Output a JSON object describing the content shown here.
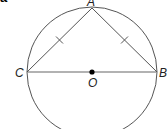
{
  "part_label": "a",
  "figure": {
    "circle": {
      "center": "O",
      "cx": 92,
      "cy": 72,
      "r": 65,
      "stroke": "#555555"
    },
    "points": {
      "A": {
        "label": "A",
        "x": 92,
        "y": 8
      },
      "B": {
        "label": "B",
        "x": 157,
        "y": 72
      },
      "C": {
        "label": "C",
        "x": 27,
        "y": 72
      },
      "O": {
        "label": "O",
        "x": 92,
        "y": 72
      }
    },
    "segments": [
      {
        "from": "C",
        "to": "A",
        "tick_marks": 1
      },
      {
        "from": "A",
        "to": "B",
        "tick_marks": 1
      },
      {
        "from": "C",
        "to": "B",
        "tick_marks": 0,
        "diameter": true
      }
    ],
    "colors": {
      "line": "#555555",
      "diameter": "#999999",
      "point": "#000000"
    }
  }
}
